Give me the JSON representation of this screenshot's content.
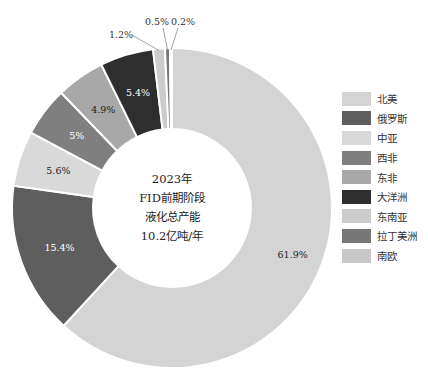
{
  "chart_data": {
    "type": "pie",
    "subtype": "donut",
    "title": "",
    "center_label": [
      "2023年",
      "FID前期阶段",
      "液化总产能",
      "10.2亿吨/年"
    ],
    "categories": [
      "北美",
      "俄罗斯",
      "中亚",
      "西非",
      "东非",
      "大洋洲",
      "东南亚",
      "拉丁美洲",
      "南欧"
    ],
    "values": [
      61.9,
      15.4,
      5.6,
      5.0,
      4.9,
      5.4,
      1.2,
      0.5,
      0.2
    ],
    "value_labels": [
      "61.9%",
      "15.4%",
      "5.6%",
      "5%",
      "4.9%",
      "5.4%",
      "1.2%",
      "0.5%",
      "0.2%"
    ],
    "colors": [
      "#d4d4d4",
      "#5e5e5e",
      "#d9d9d9",
      "#7f7f7f",
      "#a8a8a8",
      "#2e2e2e",
      "#cccccc",
      "#777777",
      "#c8c8c8"
    ],
    "start_angle_deg": 0,
    "direction": "clockwise",
    "legend_position": "right"
  },
  "legend": {
    "items": [
      {
        "label": "北美",
        "color": "#d4d4d4"
      },
      {
        "label": "俄罗斯",
        "color": "#5e5e5e"
      },
      {
        "label": "中亚",
        "color": "#d9d9d9"
      },
      {
        "label": "西非",
        "color": "#7f7f7f"
      },
      {
        "label": "东非",
        "color": "#a8a8a8"
      },
      {
        "label": "大洋洲",
        "color": "#2e2e2e"
      },
      {
        "label": "东南亚",
        "color": "#cccccc"
      },
      {
        "label": "拉丁美洲",
        "color": "#777777"
      },
      {
        "label": "南欧",
        "color": "#c8c8c8"
      }
    ]
  },
  "center": {
    "line1": "2023年",
    "line2": "FID前期阶段",
    "line3": "液化总产能",
    "line4": "10.2亿吨/年"
  }
}
